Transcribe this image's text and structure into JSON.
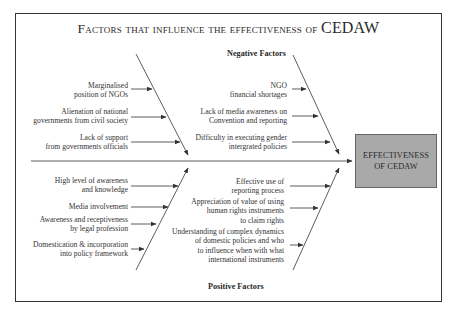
{
  "title": {
    "prefix": "Factors that influence the effectiveness of ",
    "emphasis": "CEDAW"
  },
  "headings": {
    "negative": "Negative Factors",
    "positive": "Positive Factors"
  },
  "effect": {
    "line1": "EFFECTIVENESS",
    "line2": "OF CEDAW"
  },
  "negative_left": [
    {
      "line1": "Marginalised",
      "line2": "position of NGOs"
    },
    {
      "line1": "Alienation of national",
      "line2": "governments from civil society"
    },
    {
      "line1": "Lack of support",
      "line2": "from governments officials"
    }
  ],
  "negative_right": [
    {
      "line1": "NGO",
      "line2": "financial shortages"
    },
    {
      "line1": "Lack of media awareness on",
      "line2": "Convention and reporting"
    },
    {
      "line1": "Difficulty in executing gender",
      "line2": "intergrated policies"
    }
  ],
  "positive_left": [
    {
      "line1": "High level of awareness",
      "line2": "and knowledge"
    },
    {
      "line1": "Media involvement"
    },
    {
      "line1": "Awareness and receptiveness",
      "line2": "by legal profession"
    },
    {
      "line1": "Domestication & incorporation",
      "line2": "into policy framework"
    }
  ],
  "positive_right": [
    {
      "line1": "Effective use of",
      "line2": "reporting process"
    },
    {
      "line1": "Appreciation of value of using",
      "line2": "human rights instruments",
      "line3": "to claim rights"
    },
    {
      "line1": "Understanding of complex dynamics",
      "line2": "of domestic policies and who",
      "line3": "to influence when with what",
      "line4": "international instruments"
    }
  ],
  "colors": {
    "line": "#333333",
    "box_fill": "#a9a9a9",
    "frame": "#333333"
  }
}
